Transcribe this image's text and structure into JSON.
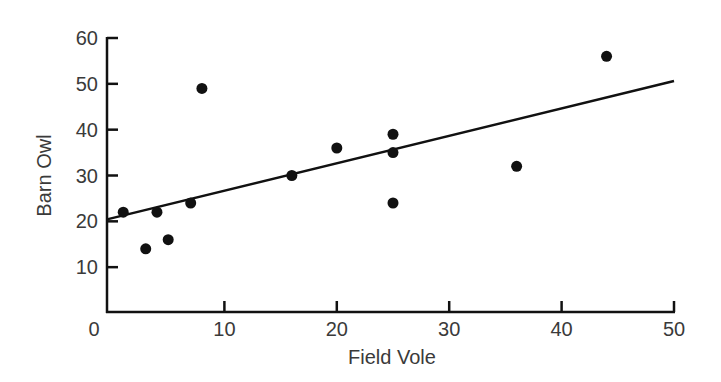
{
  "chart_data": {
    "type": "scatter",
    "title": "",
    "xlabel": "Field Vole",
    "ylabel": "Barn Owl",
    "xlim": [
      0,
      50
    ],
    "ylim": [
      0,
      60
    ],
    "xticks": [
      0,
      10,
      20,
      30,
      40,
      50
    ],
    "yticks": [
      10,
      20,
      30,
      40,
      50,
      60
    ],
    "xtick_labels": [
      "0",
      "10",
      "20",
      "30",
      "40",
      "50"
    ],
    "ytick_labels": [
      "10",
      "20",
      "30",
      "40",
      "50",
      "60"
    ],
    "grid": false,
    "legend": "none",
    "series": [
      {
        "name": "observations",
        "color": "#111111",
        "points": [
          {
            "x": 1,
            "y": 22
          },
          {
            "x": 3,
            "y": 14
          },
          {
            "x": 4,
            "y": 22
          },
          {
            "x": 5,
            "y": 16
          },
          {
            "x": 7,
            "y": 24
          },
          {
            "x": 8,
            "y": 49
          },
          {
            "x": 16,
            "y": 30
          },
          {
            "x": 20,
            "y": 36
          },
          {
            "x": 25,
            "y": 39
          },
          {
            "x": 25,
            "y": 35
          },
          {
            "x": 25,
            "y": 24
          },
          {
            "x": 36,
            "y": 32
          },
          {
            "x": 44,
            "y": 56
          }
        ]
      }
    ],
    "trendline": {
      "type": "linear",
      "x_start": 0,
      "y_start": 20.7,
      "x_end": 50,
      "y_end": 50.6,
      "color": "#111111"
    }
  }
}
